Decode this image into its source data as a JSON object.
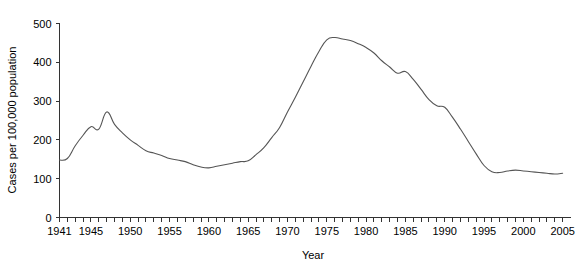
{
  "chart_data": {
    "type": "line",
    "title": "",
    "xlabel": "Year",
    "ylabel": "Cases per 100,000 population",
    "xlim": [
      1941,
      2006
    ],
    "ylim": [
      0,
      500
    ],
    "grid": false,
    "legend": "none",
    "y_ticks": [
      0,
      100,
      200,
      300,
      400,
      500
    ],
    "y_tick_labels": [
      "0",
      "100",
      "200",
      "300",
      "400",
      "500"
    ],
    "x_tick_labels": [
      "1941",
      "1945",
      "1950",
      "1955",
      "1960",
      "1965",
      "1970",
      "1975",
      "1980",
      "1985",
      "1990",
      "1995",
      "2000",
      "2005"
    ],
    "x_tick_label_years": [
      1941,
      1945,
      1950,
      1955,
      1960,
      1965,
      1970,
      1975,
      1980,
      1985,
      1990,
      1995,
      2000,
      2005
    ],
    "x_minor_tick_step": 1,
    "line_color": "#555555",
    "axis_color": "#333333",
    "background_color": "#ffffff",
    "x": [
      1941,
      1942,
      1943,
      1944,
      1945,
      1946,
      1947,
      1948,
      1949,
      1950,
      1951,
      1952,
      1953,
      1954,
      1955,
      1956,
      1957,
      1958,
      1959,
      1960,
      1961,
      1962,
      1963,
      1964,
      1965,
      1966,
      1967,
      1968,
      1969,
      1970,
      1971,
      1972,
      1973,
      1974,
      1975,
      1976,
      1977,
      1978,
      1979,
      1980,
      1981,
      1982,
      1983,
      1984,
      1985,
      1986,
      1987,
      1988,
      1989,
      1990,
      1991,
      1992,
      1993,
      1994,
      1995,
      1996,
      1997,
      1998,
      1999,
      2000,
      2001,
      2002,
      2003,
      2004,
      2005
    ],
    "values": [
      148,
      152,
      185,
      212,
      234,
      228,
      272,
      240,
      218,
      200,
      186,
      172,
      166,
      160,
      152,
      148,
      144,
      136,
      130,
      128,
      132,
      136,
      140,
      144,
      146,
      162,
      180,
      206,
      232,
      272,
      310,
      350,
      390,
      428,
      458,
      464,
      460,
      456,
      448,
      438,
      424,
      404,
      388,
      372,
      376,
      356,
      330,
      304,
      288,
      284,
      258,
      228,
      196,
      164,
      134,
      118,
      116,
      120,
      122,
      120,
      118,
      116,
      114,
      112,
      114
    ]
  }
}
